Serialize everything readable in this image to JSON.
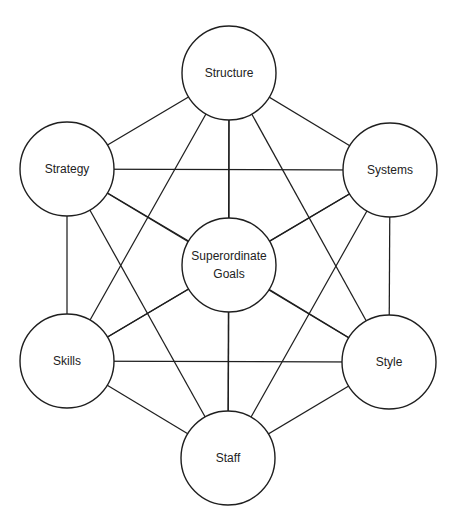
{
  "diagram": {
    "colors": {
      "line": "#1f1f1f",
      "node_fill": "#ffffff",
      "text": "#222222",
      "background": "#ffffff"
    },
    "nodes": [
      {
        "id": "structure",
        "label": [
          "Structure"
        ],
        "cx": 229,
        "cy": 73,
        "r": 47
      },
      {
        "id": "strategy",
        "label": [
          "Strategy"
        ],
        "cx": 67,
        "cy": 169,
        "r": 47
      },
      {
        "id": "systems",
        "label": [
          "Systems"
        ],
        "cx": 390,
        "cy": 170,
        "r": 47
      },
      {
        "id": "superordinate-goals",
        "label": [
          "Superordinate",
          "Goals"
        ],
        "cx": 229,
        "cy": 265,
        "r": 47
      },
      {
        "id": "skills",
        "label": [
          "Skills"
        ],
        "cx": 67,
        "cy": 361,
        "r": 47
      },
      {
        "id": "style",
        "label": [
          "Style"
        ],
        "cx": 389,
        "cy": 362,
        "r": 47
      },
      {
        "id": "staff",
        "label": [
          "Staff"
        ],
        "cx": 228,
        "cy": 458,
        "r": 47
      }
    ],
    "edges": "complete"
  }
}
